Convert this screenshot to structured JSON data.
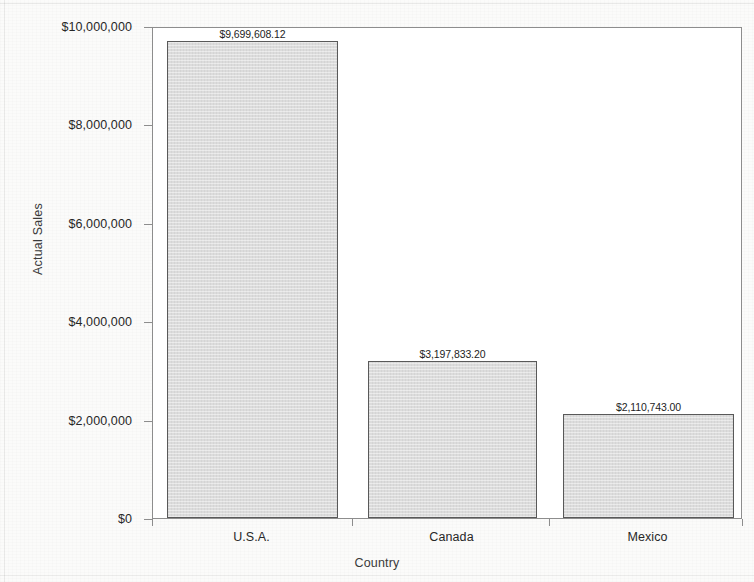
{
  "chart_data": {
    "type": "bar",
    "title": "",
    "xlabel": "Country",
    "ylabel": "Actual Sales",
    "categories": [
      "U.S.A.",
      "Canada",
      "Mexico"
    ],
    "values": [
      9699608.12,
      3197833.2,
      2110743.0
    ],
    "value_labels": [
      "$9,699,608.12",
      "$3,197,833.20",
      "$2,110,743.00"
    ],
    "ylim": [
      0,
      10000000
    ],
    "ytick_values": [
      0,
      2000000,
      4000000,
      6000000,
      8000000,
      10000000
    ],
    "ytick_labels": [
      "$0",
      "$2,000,000",
      "$4,000,000",
      "$6,000,000",
      "$8,000,000",
      "$10,000,000"
    ],
    "grid": false,
    "legend": null,
    "legend_position": "none",
    "bar_fill_color": "#dcdcdc",
    "bar_border_color": "#595959",
    "plot_border_color": "#8d8d8d",
    "background_color": "#fbfbfa",
    "text_color": "#272727"
  },
  "axes": {
    "y_title": "Actual Sales",
    "x_title": "Country"
  }
}
